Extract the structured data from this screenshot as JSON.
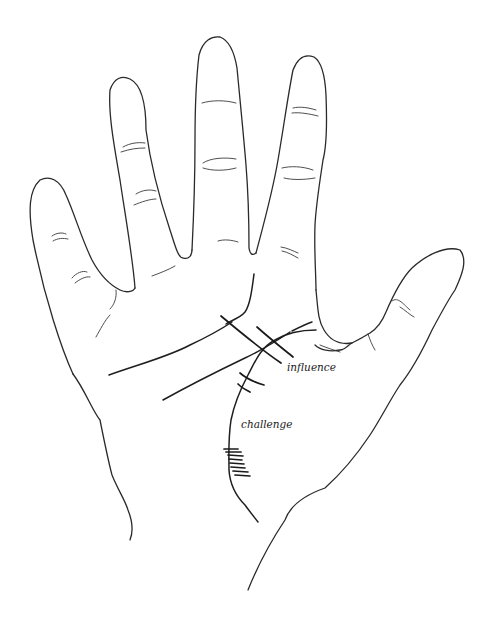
{
  "diagram": {
    "labels": {
      "influence": "influence",
      "challenge": "challenge"
    },
    "elements": [
      {
        "id": "hand-outline",
        "description": "outline of open palm with four fingers and thumb"
      },
      {
        "id": "heart-line",
        "description": "upper horizontal palm line"
      },
      {
        "id": "head-line",
        "description": "middle diagonal palm line"
      },
      {
        "id": "life-line",
        "description": "curved line around thumb base"
      },
      {
        "id": "influence-marks",
        "description": "parallel crossing bars where lines meet near thumb base"
      },
      {
        "id": "challenge-bars",
        "description": "short crossing bars on life line"
      },
      {
        "id": "challenge-ladder",
        "description": "ladder of short horizontal bars on lower life line"
      }
    ],
    "colors": {
      "ink": "#1e1e1e",
      "background": "#ffffff"
    }
  }
}
